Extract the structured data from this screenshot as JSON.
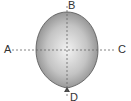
{
  "diagram": {
    "labels": {
      "top": "B",
      "left": "A",
      "right": "C",
      "bottom": "D"
    },
    "colors": {
      "balloon_light": "#f2f2f2",
      "balloon_dark": "#8a8a8a",
      "outline": "#555555",
      "axis": "#666666"
    }
  }
}
